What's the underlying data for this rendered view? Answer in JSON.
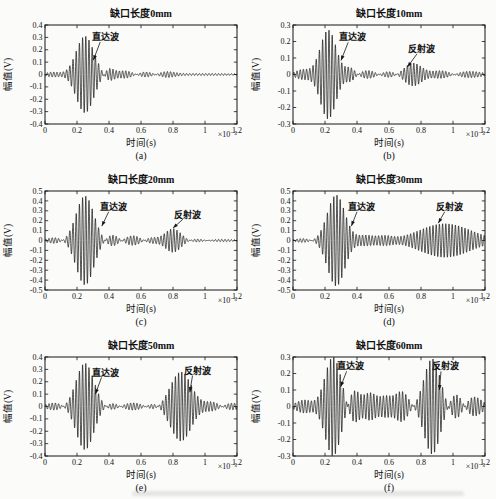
{
  "figure": {
    "background": "#fbfbfa",
    "line_color": "#151515",
    "grid": "off",
    "legend": "none"
  },
  "chart_data": [
    {
      "type": "line",
      "label": "(a)",
      "title": "缺口长度0mm",
      "xlabel": "时间(s)",
      "ylabel": "幅值(V)",
      "x_scale_label": "×10⁻³",
      "xlim": [
        0,
        1.2
      ],
      "ylim": [
        -0.4,
        0.4
      ],
      "xticks": [
        "0",
        "0.2",
        "0.4",
        "0.6",
        "0.8",
        "1",
        "1.2"
      ],
      "yticks": [
        "0.4",
        "0.3",
        "0.2",
        "0.1",
        "0",
        "-0.1",
        "-0.2",
        "-0.3",
        "-0.4"
      ],
      "carrier_cycles_per_ms": 50,
      "packets": [
        {
          "a": 0.02,
          "c": 0.05,
          "s": 0.045
        },
        {
          "a": 0.31,
          "c": 0.25,
          "s": 0.055,
          "wave": "direct"
        },
        {
          "a": 0.05,
          "c": 0.4,
          "s": 0.03
        },
        {
          "a": 0.03,
          "c": 0.5,
          "s": 0.05
        },
        {
          "a": 0.025,
          "c": 0.63,
          "s": 0.05
        },
        {
          "a": 0.02,
          "c": 0.76,
          "s": 0.05
        },
        {
          "a": 0.008,
          "c": 1.0,
          "s": 0.25
        }
      ],
      "annotations": [
        {
          "text": "直达波",
          "tx": 0.375,
          "ty": 0.3,
          "sx": 0.345,
          "sy": 0.262,
          "ax": 0.302,
          "ay": 0.115
        }
      ]
    },
    {
      "type": "line",
      "label": "(b)",
      "title": "缺口长度10mm",
      "xlabel": "时间(s)",
      "ylabel": "幅值(V)",
      "x_scale_label": "×10⁻³",
      "xlim": [
        0,
        1.2
      ],
      "ylim": [
        -0.3,
        0.3
      ],
      "xticks": [
        "0",
        "0.2",
        "0.4",
        "0.6",
        "0.8",
        "1",
        "1.2"
      ],
      "yticks": [
        "0.3",
        "0.2",
        "0.1",
        "0",
        "-0.1",
        "-0.2",
        "-0.3"
      ],
      "carrier_cycles_per_ms": 50,
      "packets": [
        {
          "a": 0.03,
          "c": 0.06,
          "s": 0.045
        },
        {
          "a": 0.27,
          "c": 0.22,
          "s": 0.05,
          "wave": "direct"
        },
        {
          "a": 0.04,
          "c": 0.36,
          "s": 0.03
        },
        {
          "a": 0.025,
          "c": 0.47,
          "s": 0.05
        },
        {
          "a": 0.02,
          "c": 0.6,
          "s": 0.05
        },
        {
          "a": 0.07,
          "c": 0.75,
          "s": 0.055,
          "wave": "reflected"
        },
        {
          "a": 0.025,
          "c": 0.93,
          "s": 0.06
        },
        {
          "a": 0.02,
          "c": 1.1,
          "s": 0.08
        }
      ],
      "annotations": [
        {
          "text": "直达波",
          "tx": 0.37,
          "ty": 0.225,
          "sx": 0.345,
          "sy": 0.195,
          "ax": 0.3,
          "ay": 0.085
        },
        {
          "text": "反射波",
          "tx": 0.805,
          "ty": 0.155,
          "sx": 0.775,
          "sy": 0.125,
          "ax": 0.715,
          "ay": 0.045
        }
      ]
    },
    {
      "type": "line",
      "label": "(c)",
      "title": "缺口长度20mm",
      "xlabel": "时间(s)",
      "ylabel": "幅值(V)",
      "x_scale_label": "×10⁻³",
      "xlim": [
        0,
        1.2
      ],
      "ylim": [
        -0.5,
        0.5
      ],
      "xticks": [
        "0",
        "0.2",
        "0.4",
        "0.6",
        "0.8",
        "1",
        "1.2"
      ],
      "yticks": [
        "0.5",
        "0.4",
        "0.3",
        "0.2",
        "0.1",
        "0",
        "-0.1",
        "-0.2",
        "-0.3",
        "-0.4",
        "-0.5"
      ],
      "carrier_cycles_per_ms": 50,
      "packets": [
        {
          "a": 0.03,
          "c": 0.06,
          "s": 0.045
        },
        {
          "a": 0.45,
          "c": 0.25,
          "s": 0.055,
          "wave": "direct"
        },
        {
          "a": 0.06,
          "c": 0.42,
          "s": 0.04
        },
        {
          "a": 0.05,
          "c": 0.55,
          "s": 0.05
        },
        {
          "a": 0.03,
          "c": 0.66,
          "s": 0.04
        },
        {
          "a": 0.12,
          "c": 0.8,
          "s": 0.05,
          "wave": "reflected"
        },
        {
          "a": 0.02,
          "c": 0.95,
          "s": 0.05
        },
        {
          "a": 0.012,
          "c": 1.1,
          "s": 0.1
        }
      ],
      "annotations": [
        {
          "text": "直达波",
          "tx": 0.425,
          "ty": 0.335,
          "sx": 0.398,
          "sy": 0.29,
          "ax": 0.355,
          "ay": 0.145
        },
        {
          "text": "反射波",
          "tx": 0.89,
          "ty": 0.255,
          "sx": 0.862,
          "sy": 0.215,
          "ax": 0.8,
          "ay": 0.125
        }
      ]
    },
    {
      "type": "line",
      "label": "(d)",
      "title": "缺口长度30mm",
      "xlabel": "时间(s)",
      "ylabel": "幅值(V)",
      "x_scale_label": "×10⁻³",
      "xlim": [
        0,
        1.2
      ],
      "ylim": [
        -0.5,
        0.5
      ],
      "xticks": [
        "0",
        "0.2",
        "0.4",
        "0.6",
        "0.8",
        "1",
        "1.2"
      ],
      "yticks": [
        "0.5",
        "0.4",
        "0.3",
        "0.2",
        "0.1",
        "0",
        "-0.1",
        "-0.2",
        "-0.3",
        "-0.4",
        "-0.5"
      ],
      "carrier_cycles_per_ms": 50,
      "packets": [
        {
          "a": 0.02,
          "c": 0.06,
          "s": 0.045
        },
        {
          "a": 0.46,
          "c": 0.27,
          "s": 0.055,
          "wave": "direct"
        },
        {
          "a": 0.05,
          "c": 0.45,
          "s": 0.05
        },
        {
          "a": 0.04,
          "c": 0.57,
          "s": 0.05
        },
        {
          "a": 0.17,
          "c": 0.95,
          "s": 0.16,
          "wave": "reflected"
        }
      ],
      "annotations": [
        {
          "text": "直达波",
          "tx": 0.425,
          "ty": 0.335,
          "sx": 0.4,
          "sy": 0.29,
          "ax": 0.365,
          "ay": 0.145
        },
        {
          "text": "反射波",
          "tx": 0.975,
          "ty": 0.335,
          "sx": 0.948,
          "sy": 0.29,
          "ax": 0.908,
          "ay": 0.175
        }
      ]
    },
    {
      "type": "line",
      "label": "(e)",
      "title": "缺口长度50mm",
      "xlabel": "时间(s)",
      "ylabel": "幅值(V)",
      "x_scale_label": "×10⁻³",
      "xlim": [
        0,
        1.2
      ],
      "ylim": [
        -0.4,
        0.4
      ],
      "xticks": [
        "0",
        "0.2",
        "0.4",
        "0.6",
        "0.8",
        "1",
        "1.2"
      ],
      "yticks": [
        "0.4",
        "0.3",
        "0.2",
        "0.1",
        "0",
        "-0.1",
        "-0.2",
        "-0.3",
        "-0.4"
      ],
      "carrier_cycles_per_ms": 50,
      "packets": [
        {
          "a": 0.03,
          "c": 0.06,
          "s": 0.05
        },
        {
          "a": 0.35,
          "c": 0.25,
          "s": 0.055,
          "wave": "direct"
        },
        {
          "a": 0.03,
          "c": 0.42,
          "s": 0.04
        },
        {
          "a": 0.03,
          "c": 0.55,
          "s": 0.06
        },
        {
          "a": 0.03,
          "c": 0.68,
          "s": 0.04
        },
        {
          "a": 0.28,
          "c": 0.85,
          "s": 0.065,
          "wave": "reflected"
        },
        {
          "a": 0.04,
          "c": 1.05,
          "s": 0.05
        },
        {
          "a": 0.03,
          "c": 1.16,
          "s": 0.06
        }
      ],
      "annotations": [
        {
          "text": "直达波",
          "tx": 0.38,
          "ty": 0.27,
          "sx": 0.353,
          "sy": 0.235,
          "ax": 0.315,
          "ay": 0.1
        },
        {
          "text": "反射波",
          "tx": 0.95,
          "ty": 0.285,
          "sx": 0.922,
          "sy": 0.25,
          "ax": 0.905,
          "ay": 0.115
        }
      ]
    },
    {
      "type": "line",
      "label": "(f)",
      "title": "缺口长度60mm",
      "xlabel": "时间(s)",
      "ylabel": "幅值(V)",
      "x_scale_label": "×10⁻³",
      "xlim": [
        0,
        1.2
      ],
      "ylim": [
        -0.3,
        0.3
      ],
      "xticks": [
        "0",
        "0.2",
        "0.4",
        "0.6",
        "0.8",
        "1",
        "1.2"
      ],
      "yticks": [
        "0.3",
        "0.2",
        "0.1",
        "0",
        "-0.1",
        "-0.2",
        "-0.3"
      ],
      "carrier_cycles_per_ms": 50,
      "packets": [
        {
          "a": 0.04,
          "c": 0.07,
          "s": 0.05
        },
        {
          "a": 0.3,
          "c": 0.25,
          "s": 0.05,
          "wave": "direct"
        },
        {
          "a": 0.1,
          "c": 0.38,
          "s": 0.035
        },
        {
          "a": 0.08,
          "c": 0.48,
          "s": 0.04
        },
        {
          "a": 0.06,
          "c": 0.58,
          "s": 0.04
        },
        {
          "a": 0.09,
          "c": 0.68,
          "s": 0.04
        },
        {
          "a": 0.29,
          "c": 0.87,
          "s": 0.05,
          "wave": "reflected"
        },
        {
          "a": 0.08,
          "c": 1.02,
          "s": 0.04
        },
        {
          "a": 0.06,
          "c": 1.13,
          "s": 0.05
        }
      ],
      "annotations": [
        {
          "text": "直达波",
          "tx": 0.36,
          "ty": 0.245,
          "sx": 0.335,
          "sy": 0.213,
          "ax": 0.298,
          "ay": 0.12
        },
        {
          "text": "反射波",
          "tx": 0.95,
          "ty": 0.245,
          "sx": 0.925,
          "sy": 0.213,
          "ax": 0.915,
          "ay": 0.1
        }
      ]
    }
  ]
}
